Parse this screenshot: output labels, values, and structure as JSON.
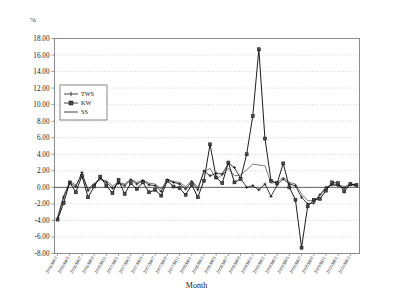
{
  "axis_unit_label": "%",
  "x_axis_title": "Month",
  "legend": {
    "items": [
      {
        "label": "TWS",
        "marker": "cross"
      },
      {
        "label": "KW",
        "marker": "square"
      },
      {
        "label": "SS",
        "marker": "line"
      }
    ]
  },
  "chart_data": {
    "type": "line",
    "title": "",
    "xlabel": "Month",
    "ylabel": "%",
    "ylim": [
      -8,
      18
    ],
    "ytick_step": 2,
    "grid": true,
    "legend_position": "top-left-inside",
    "ytick_labels": [
      "18.00",
      "16.00",
      "14.00",
      "12.00",
      "10.00",
      "8.00",
      "6.00",
      "4.00",
      "2.00",
      "0.00",
      "-2.00",
      "-4.00",
      "-6.00",
      "-8.00"
    ],
    "categories": [
      "2006/M03",
      "2006/M04",
      "2006/M05",
      "2006/M06",
      "2006/M07",
      "2006/M08",
      "2006/M09",
      "2006/M10",
      "2006/M11",
      "2006/M12",
      "2007/M01",
      "2007/M02",
      "2007/M03",
      "2007/M04",
      "2007/M05",
      "2007/M06",
      "2007/M07",
      "2007/M08",
      "2007/M09",
      "2007/M10",
      "2007/M11",
      "2007/M12",
      "2008/M01",
      "2008/M02",
      "2008/M03",
      "2008/M04",
      "2008/M05",
      "2008/M06",
      "2008/M07",
      "2008/M08",
      "2008/M09",
      "2008/M10",
      "2008/M11",
      "2008/M12",
      "2009/M01",
      "2009/M02",
      "2009/M03",
      "2009/M04",
      "2009/M05",
      "2009/M06",
      "2009/M07",
      "2009/M08",
      "2009/M09",
      "2009/M10",
      "2009/M11",
      "2009/M12",
      "2010/M01",
      "2010/M02",
      "2010/M03",
      "2010/M04"
    ],
    "xtick_labels_shown": [
      "2006/M03",
      "2006/M05",
      "2006/M07",
      "2006/M09",
      "2006/M11",
      "2007/M01",
      "2007/M03",
      "2007/M05",
      "2007/M07",
      "2007/M09",
      "2007/M11",
      "2008/M01",
      "2008/M03",
      "2008/M05",
      "2008/M07",
      "2008/M09",
      "2008/M11",
      "2009/M01",
      "2009/M03",
      "2009/M05",
      "2009/M07",
      "2009/M09",
      "2009/M11",
      "2010/M01",
      "2010/M03"
    ],
    "series": [
      {
        "name": "TWS",
        "marker": "cross",
        "values": [
          -3.8,
          -1.2,
          0.5,
          0.1,
          1.8,
          -0.4,
          0.3,
          1.1,
          0.6,
          -0.1,
          0.5,
          0.2,
          0.9,
          0.4,
          0.8,
          0.3,
          0.2,
          -0.5,
          0.9,
          0.6,
          0.4,
          -0.2,
          0.7,
          -0.3,
          2.0,
          1.4,
          1.7,
          1.6,
          2.9,
          2.4,
          1.1,
          0.0,
          0.2,
          -0.3,
          0.4,
          -1.1,
          0.3,
          1.0,
          0.4,
          0.2,
          -1.2,
          -2.0,
          -1.9,
          -0.9,
          0.0,
          0.3,
          0.2,
          -0.1,
          0.3,
          0.2
        ]
      },
      {
        "name": "KW",
        "marker": "square",
        "values": [
          -3.9,
          -1.9,
          0.6,
          -0.6,
          1.4,
          -1.2,
          0.1,
          1.3,
          0.2,
          -0.7,
          0.9,
          -0.8,
          0.5,
          -0.2,
          0.6,
          -0.6,
          -0.3,
          -1.0,
          0.8,
          0.1,
          -0.1,
          -0.9,
          0.3,
          -1.2,
          0.8,
          5.2,
          1.2,
          0.5,
          3.0,
          0.6,
          1.0,
          4.0,
          8.6,
          16.7,
          5.9,
          0.8,
          0.5,
          2.9,
          0.0,
          -1.5,
          -7.3,
          -2.3,
          -1.5,
          -1.4,
          -0.4,
          0.6,
          0.5,
          -0.5,
          0.4,
          0.3
        ]
      },
      {
        "name": "SS",
        "marker": "line",
        "values": [
          -3.6,
          -1.0,
          0.7,
          0.3,
          1.3,
          -0.2,
          0.5,
          0.9,
          0.8,
          0.2,
          0.6,
          0.4,
          1.0,
          0.6,
          0.9,
          0.5,
          0.4,
          -0.2,
          1.0,
          0.7,
          0.6,
          0.1,
          0.8,
          0.0,
          1.8,
          2.3,
          1.0,
          1.5,
          2.3,
          1.4,
          1.5,
          2.1,
          2.8,
          2.7,
          2.6,
          0.5,
          0.6,
          1.2,
          0.6,
          0.4,
          -0.8,
          -1.6,
          -1.6,
          -1.0,
          -0.2,
          0.4,
          0.3,
          0.1,
          0.4,
          0.3
        ]
      }
    ]
  }
}
